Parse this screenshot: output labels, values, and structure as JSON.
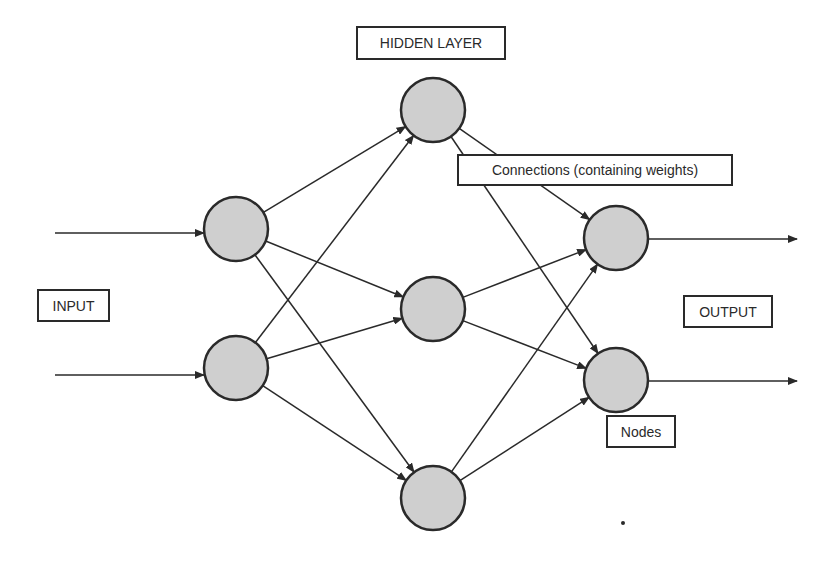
{
  "diagram": {
    "colors": {
      "stroke": "#2a2a2a",
      "node_fill": "#cfcfcf",
      "background": "#ffffff"
    },
    "labels": {
      "hidden_layer": "HIDDEN LAYER",
      "connections": "Connections (containing weights)",
      "input": "INPUT",
      "output": "OUTPUT",
      "nodes": "Nodes"
    },
    "layers": [
      {
        "name": "input",
        "nodes": [
          {
            "x": 236,
            "y": 229
          },
          {
            "x": 236,
            "y": 368
          }
        ]
      },
      {
        "name": "hidden",
        "nodes": [
          {
            "x": 433,
            "y": 110
          },
          {
            "x": 433,
            "y": 309
          },
          {
            "x": 433,
            "y": 498
          }
        ]
      },
      {
        "name": "output",
        "nodes": [
          {
            "x": 616,
            "y": 238
          },
          {
            "x": 616,
            "y": 380
          }
        ]
      }
    ],
    "node_radius": 32,
    "input_arrows": [
      {
        "x1": 55,
        "y1": 233,
        "x2": 204,
        "y2": 233
      },
      {
        "x1": 55,
        "y1": 375,
        "x2": 204,
        "y2": 375
      }
    ],
    "output_arrows": [
      {
        "x1": 648,
        "y1": 239,
        "x2": 797,
        "y2": 239
      },
      {
        "x1": 648,
        "y1": 381,
        "x2": 797,
        "y2": 381
      }
    ],
    "connections": "fully-connected input→hidden and hidden→output"
  }
}
